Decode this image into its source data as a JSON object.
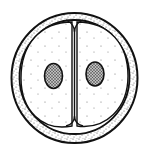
{
  "diagram": {
    "colors": {
      "background": "#ffffff",
      "stroke": "#111111",
      "stipple": "#555555",
      "nucleus_fill": "#9a9a9a"
    },
    "parts": [
      {
        "id": "outer-envelope",
        "label": "fertilization envelope"
      },
      {
        "id": "perivitelline-zone",
        "label": "stippled outer layer"
      },
      {
        "id": "left-blastomere",
        "label": "blastomere"
      },
      {
        "id": "right-blastomere",
        "label": "blastomere"
      },
      {
        "id": "left-nucleus",
        "label": "nucleus"
      },
      {
        "id": "right-nucleus",
        "label": "nucleus"
      },
      {
        "id": "cleavage-furrow",
        "label": "cleavage plane"
      }
    ]
  }
}
